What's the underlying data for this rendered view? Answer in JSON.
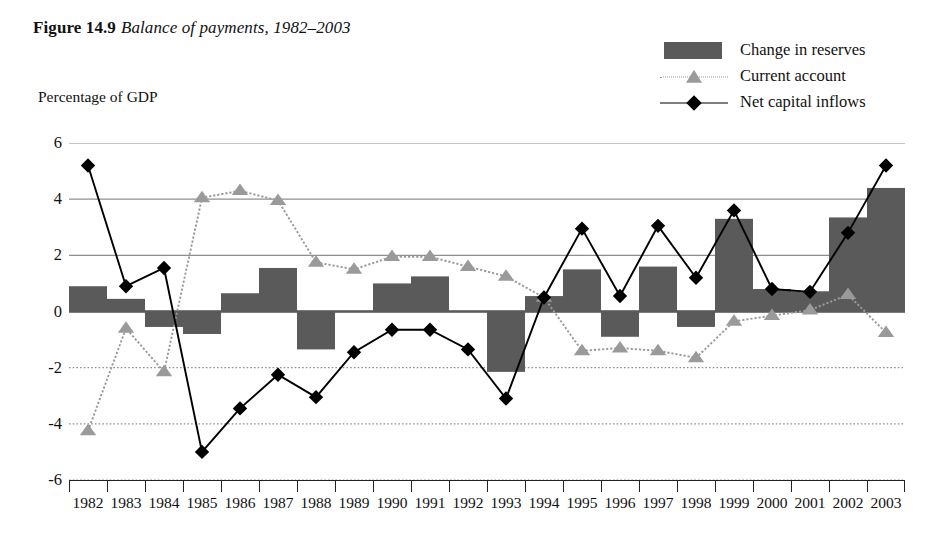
{
  "figure": {
    "number": "Figure 14.9",
    "caption": "Balance of payments, 1982–2003"
  },
  "axis_title": "Percentage of GDP",
  "legend": {
    "position": "top-right",
    "items": [
      {
        "label": "Change in reserves",
        "marker": "bar-swatch",
        "color": "#5a5a5a"
      },
      {
        "label": "Current account",
        "marker": "triangle-dotted-line",
        "color": "#9a9a9a"
      },
      {
        "label": "Net capital inflows",
        "marker": "diamond-solid-line",
        "color": "#000000"
      }
    ]
  },
  "colors": {
    "bar": "#5a5a5a",
    "current_account": "#9a9a9a",
    "net_capital": "#000000",
    "gridline": "#8f8f8f",
    "axis": "#222222",
    "background": "#ffffff"
  },
  "chart_data": {
    "type": "bar",
    "title": "Balance of payments, 1982–2003",
    "xlabel": "",
    "ylabel": "Percentage of GDP",
    "ylim": [
      -6,
      6
    ],
    "yticks": [
      6,
      4,
      2,
      0,
      -2,
      -4,
      -6
    ],
    "ytick_labels": [
      "6",
      "4",
      "2",
      "0",
      "-2",
      "-4",
      "-6"
    ],
    "grid": true,
    "legend_position": "top-right",
    "categories": [
      "1982",
      "1983",
      "1984",
      "1985",
      "1986",
      "1987",
      "1988",
      "1989",
      "1990",
      "1991",
      "1992",
      "1993",
      "1994",
      "1995",
      "1996",
      "1997",
      "1998",
      "1999",
      "2000",
      "2001",
      "2002",
      "2003"
    ],
    "series": [
      {
        "name": "Change in reserves",
        "type": "bar",
        "color": "#5a5a5a",
        "values": [
          0.9,
          0.45,
          -0.55,
          -0.8,
          0.65,
          1.55,
          -1.35,
          0.0,
          1.0,
          1.25,
          0.0,
          -2.15,
          0.55,
          1.5,
          -0.9,
          1.6,
          -0.55,
          3.3,
          0.8,
          0.72,
          3.35,
          4.4
        ]
      },
      {
        "name": "Current account",
        "type": "line",
        "color": "#9a9a9a",
        "marker": "triangle",
        "linestyle": "dotted",
        "values": [
          -4.25,
          -0.6,
          -2.15,
          4.05,
          4.3,
          3.95,
          1.75,
          1.5,
          1.95,
          1.95,
          1.6,
          1.25,
          0.5,
          -1.4,
          -1.3,
          -1.4,
          -1.65,
          -0.35,
          -0.15,
          0.05,
          0.6,
          -0.75
        ]
      },
      {
        "name": "Net capital inflows",
        "type": "line",
        "color": "#000000",
        "marker": "diamond",
        "linestyle": "solid",
        "values": [
          5.2,
          0.9,
          1.55,
          -5.0,
          -3.45,
          -2.25,
          -3.05,
          -1.45,
          -0.65,
          -0.65,
          -1.35,
          -3.1,
          0.5,
          2.95,
          0.55,
          3.05,
          1.2,
          3.6,
          0.8,
          0.7,
          2.8,
          5.2
        ]
      }
    ]
  }
}
